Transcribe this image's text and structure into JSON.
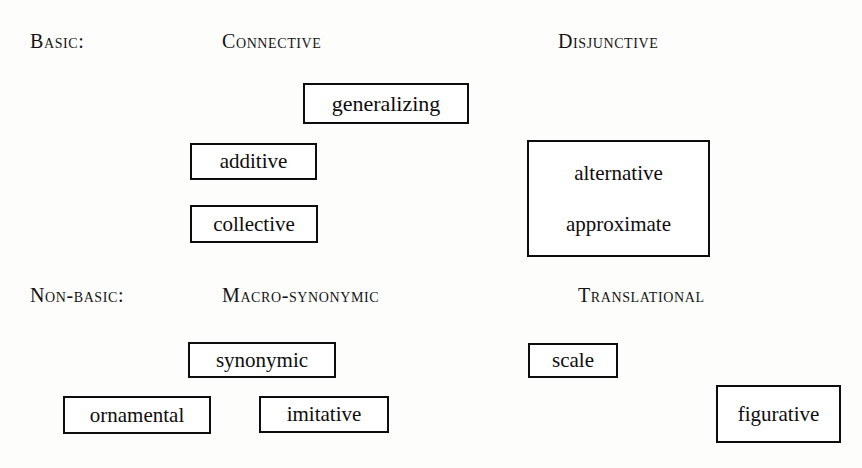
{
  "page": {
    "width": 862,
    "height": 468,
    "background": "#fdfdfc",
    "ink": "#0d0d0d"
  },
  "sections": [
    {
      "id": "basic",
      "row_label": "Basic:",
      "columns": [
        {
          "id": "connective",
          "heading": "Connective"
        },
        {
          "id": "disjunctive",
          "heading": "Disjunctive"
        }
      ]
    },
    {
      "id": "non-basic",
      "row_label": "Non-basic:",
      "columns": [
        {
          "id": "macro-synonymic",
          "heading": "Macro-synonymic"
        },
        {
          "id": "translational",
          "heading": "Translational"
        }
      ]
    }
  ],
  "headers": [
    {
      "name": "row-label-basic",
      "text": "Basic:",
      "x": 30,
      "y": 31,
      "size": 20
    },
    {
      "name": "column-heading-connective",
      "text": "Connective",
      "x": 222,
      "y": 31,
      "size": 20
    },
    {
      "name": "column-heading-disjunctive",
      "text": "Disjunctive",
      "x": 558,
      "y": 31,
      "size": 20
    },
    {
      "name": "row-label-non-basic",
      "text": "Non-basic:",
      "x": 30,
      "y": 285,
      "size": 20
    },
    {
      "name": "column-heading-macro-synonymic",
      "text": "Macro-synonymic",
      "x": 222,
      "y": 285,
      "size": 20
    },
    {
      "name": "column-heading-translational",
      "text": "Translational",
      "x": 578,
      "y": 285,
      "size": 20
    }
  ],
  "boxes": [
    {
      "name": "box-generalizing",
      "section": "basic",
      "column": "connective",
      "terms": [
        "generalizing"
      ],
      "x": 303,
      "y": 83,
      "w": 166,
      "h": 41,
      "font_size": 22
    },
    {
      "name": "box-additive",
      "section": "basic",
      "column": "connective",
      "terms": [
        "additive"
      ],
      "x": 190,
      "y": 143,
      "w": 127,
      "h": 37,
      "font_size": 21
    },
    {
      "name": "box-collective",
      "section": "basic",
      "column": "connective",
      "terms": [
        "collective"
      ],
      "x": 190,
      "y": 205,
      "w": 128,
      "h": 38,
      "font_size": 21
    },
    {
      "name": "box-alternative-approximate",
      "section": "basic",
      "column": "disjunctive",
      "terms": [
        "alternative",
        "approximate"
      ],
      "x": 527,
      "y": 140,
      "w": 183,
      "h": 117,
      "font_size": 21
    },
    {
      "name": "box-synonymic",
      "section": "non-basic",
      "column": "macro-synonymic",
      "terms": [
        "synonymic"
      ],
      "x": 188,
      "y": 342,
      "w": 148,
      "h": 36,
      "font_size": 21
    },
    {
      "name": "box-ornamental",
      "section": "non-basic",
      "column": "macro-synonymic",
      "terms": [
        "ornamental"
      ],
      "x": 63,
      "y": 396,
      "w": 148,
      "h": 38,
      "font_size": 21
    },
    {
      "name": "box-imitative",
      "section": "non-basic",
      "column": "macro-synonymic",
      "terms": [
        "imitative"
      ],
      "x": 259,
      "y": 396,
      "w": 130,
      "h": 37,
      "font_size": 21
    },
    {
      "name": "box-scale",
      "section": "non-basic",
      "column": "translational",
      "terms": [
        "scale"
      ],
      "x": 528,
      "y": 343,
      "w": 90,
      "h": 35,
      "font_size": 21
    },
    {
      "name": "box-figurative",
      "section": "non-basic",
      "column": "translational",
      "terms": [
        "figurative"
      ],
      "x": 716,
      "y": 385,
      "w": 125,
      "h": 58,
      "font_size": 21
    }
  ]
}
